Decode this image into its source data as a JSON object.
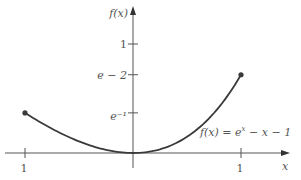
{
  "chart_data": {
    "type": "line",
    "title": "",
    "xlabel": "x",
    "ylabel": "f(x)",
    "xlim": [
      -1.02,
      1.42
    ],
    "ylim": [
      -0.14,
      1.32
    ],
    "grid": false,
    "x_ticks": [
      {
        "value": -1,
        "label": "1"
      },
      {
        "value": 1,
        "label": "1"
      }
    ],
    "y_ticks": [
      {
        "value": 1,
        "label": "1"
      },
      {
        "value": 0.718,
        "label": "e − 2"
      },
      {
        "value": 0.368,
        "label": "e⁻¹"
      }
    ],
    "series": [
      {
        "name": "f(x) = eˣ − x − 1",
        "function": "exp(x) - x - 1",
        "domain": [
          -1,
          1
        ],
        "endpoints": [
          {
            "x": -1,
            "y": 0.368
          },
          {
            "x": 1,
            "y": 0.718
          }
        ]
      }
    ],
    "annotations": [
      {
        "text_parts": [
          "f(x) = e",
          "x",
          " − x − 1"
        ],
        "near": "right-lower"
      }
    ],
    "color": "#3a3a3a"
  }
}
